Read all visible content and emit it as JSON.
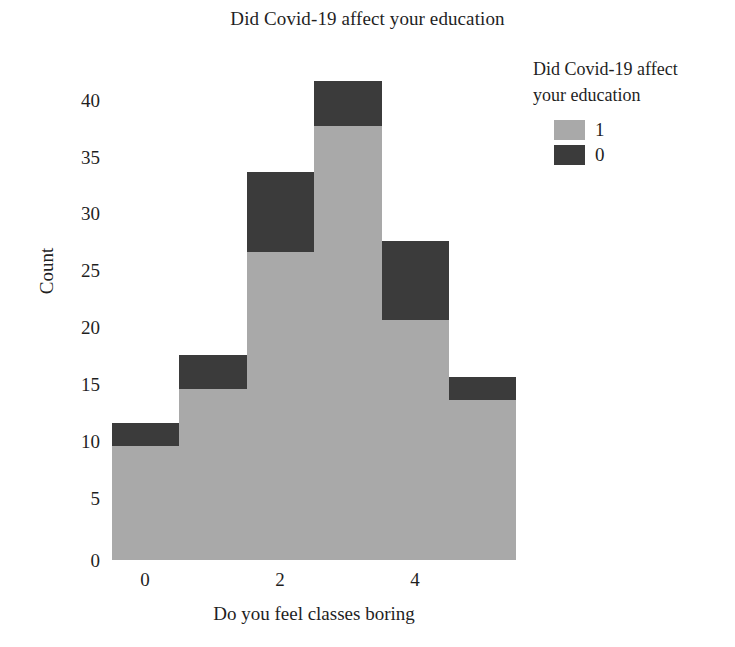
{
  "chart_data": {
    "type": "bar",
    "subtype": "stacked-histogram",
    "title": "Did Covid-19 affect your education",
    "xlabel": "Do you feel classes boring",
    "ylabel": "Count",
    "categories": [
      0,
      1,
      2,
      3,
      4,
      5
    ],
    "xtick_labels": [
      "0",
      "2",
      "4"
    ],
    "xtick_values": [
      0,
      2,
      4
    ],
    "ytick_labels": [
      "0",
      "5",
      "10",
      "15",
      "20",
      "25",
      "30",
      "35",
      "40"
    ],
    "ytick_values": [
      0,
      5,
      10,
      15,
      20,
      25,
      30,
      35,
      40
    ],
    "ylim": [
      0,
      44
    ],
    "xlim": [
      -0.5,
      5.5
    ],
    "grid": false,
    "legend": {
      "title": "Did Covid-19 affect your education",
      "title_line1": "Did Covid-19 affect",
      "title_line2": "your education",
      "position": "right",
      "entries": [
        {
          "label": "1",
          "color": "#a9a9a9"
        },
        {
          "label": "0",
          "color": "#3b3b3b"
        }
      ]
    },
    "series": [
      {
        "name": "1",
        "color": "#a9a9a9",
        "values": [
          10,
          15,
          27,
          38,
          21,
          14
        ]
      },
      {
        "name": "0",
        "color": "#3b3b3b",
        "values": [
          2,
          3,
          7,
          4,
          7,
          2
        ]
      }
    ],
    "totals": [
      12,
      18,
      34,
      42,
      28,
      16
    ]
  },
  "colors": {
    "series_light": "#a9a9a9",
    "series_dark": "#3b3b3b",
    "text": "#1f1f1f",
    "background": "#ffffff"
  }
}
